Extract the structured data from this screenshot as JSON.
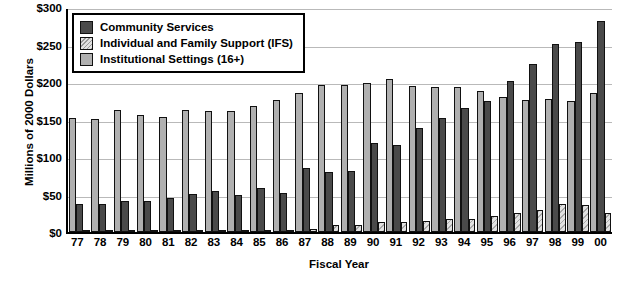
{
  "chart_data": {
    "type": "bar",
    "title": "",
    "xlabel": "Fiscal Year",
    "ylabel": "Millions of 2000 Dollars",
    "ylim": [
      0,
      300
    ],
    "ytick_labels": [
      "$300",
      "$250",
      "$200",
      "$150",
      "$100",
      "$50",
      "$0"
    ],
    "ytick_values": [
      300,
      250,
      200,
      150,
      100,
      50,
      0
    ],
    "grid": true,
    "legend_position": "top-left",
    "categories": [
      "77",
      "78",
      "79",
      "80",
      "81",
      "82",
      "83",
      "84",
      "85",
      "86",
      "87",
      "88",
      "89",
      "90",
      "91",
      "92",
      "93",
      "94",
      "95",
      "96",
      "97",
      "98",
      "99",
      "00"
    ],
    "series": [
      {
        "name": "Community Services",
        "color": "#4a4a4a",
        "values": [
          37,
          38,
          42,
          41,
          46,
          51,
          55,
          50,
          59,
          52,
          86,
          80,
          81,
          119,
          116,
          139,
          152,
          165,
          175,
          202,
          224,
          251,
          254,
          281
        ]
      },
      {
        "name": "Individual and Family Support (IFS)",
        "color": "#e2e2e2",
        "values": [
          2,
          2,
          2,
          2,
          2,
          3,
          3,
          3,
          3,
          3,
          4,
          9,
          10,
          13,
          14,
          15,
          17,
          18,
          22,
          25,
          29,
          37,
          36,
          26
        ]
      },
      {
        "name": "Institutional Settings (16+)",
        "color": "#b0b0b0",
        "values": [
          152,
          151,
          163,
          156,
          153,
          163,
          161,
          162,
          168,
          176,
          186,
          196,
          196,
          199,
          204,
          195,
          193,
          194,
          188,
          180,
          176,
          177,
          175,
          185
        ]
      }
    ]
  },
  "legend": {
    "items": [
      {
        "label": "Community Services",
        "swatch": "cs"
      },
      {
        "label": "Individual and Family Support (IFS)",
        "swatch": "ifs"
      },
      {
        "label": "Institutional Settings (16+)",
        "swatch": "inst"
      }
    ]
  }
}
